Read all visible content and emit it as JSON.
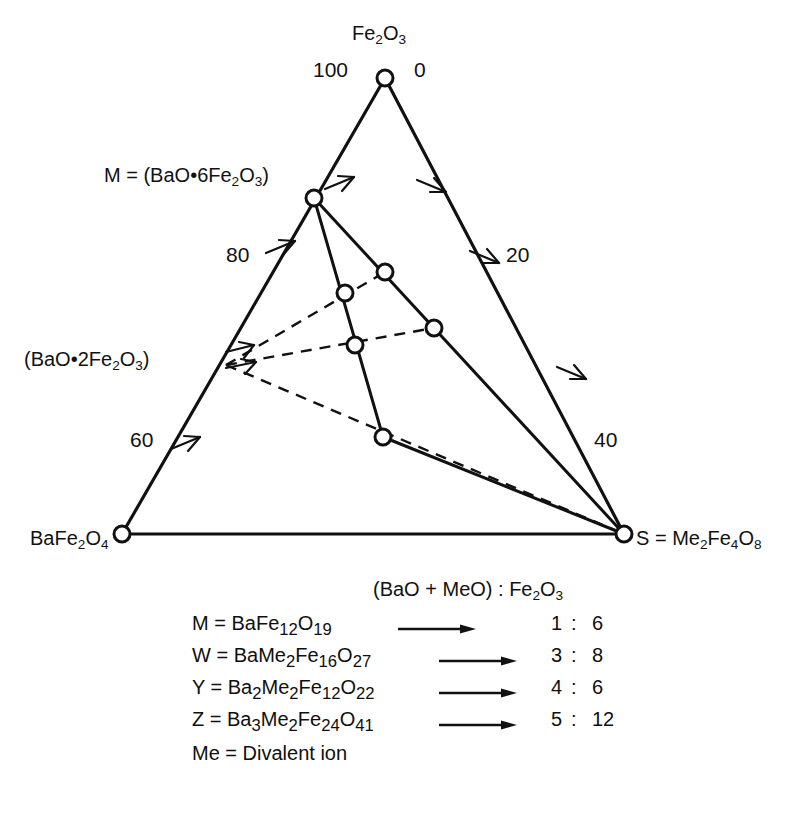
{
  "figure": {
    "type": "ternary-phase-diagram",
    "system": "BaO - MeO - Fe2O3 hexaferrite ternary diagram"
  },
  "vertices": {
    "top": {
      "label_html": "Fe<sub>2</sub>O<sub>3</sub>",
      "x": 385,
      "y": 78
    },
    "bottom_left": {
      "label_html": "BaFe<sub>2</sub>O<sub>4</sub>",
      "x": 122,
      "y": 534
    },
    "bottom_right": {
      "label_html": "S = Me<sub>2</sub>Fe<sub>4</sub>O<sub>8</sub>",
      "x": 624,
      "y": 534
    }
  },
  "interior_labels": {
    "m_phase": "M = (BaO•6Fe<sub>2</sub>O<sub>3</sub>)",
    "w_phase": "(BaO•2Fe<sub>2</sub>O<sub>3</sub>)"
  },
  "axis_ticks": [
    {
      "value": "100",
      "side": "top-left",
      "x": 313,
      "y": 60
    },
    {
      "value": "0",
      "side": "top-right",
      "x": 414,
      "y": 60
    },
    {
      "value": "80",
      "side": "left",
      "x": 235,
      "y": 245
    },
    {
      "value": "20",
      "side": "right",
      "x": 508,
      "y": 245
    },
    {
      "value": "60",
      "side": "left",
      "x": 138,
      "y": 430
    },
    {
      "value": "40",
      "side": "right",
      "x": 597,
      "y": 430
    }
  ],
  "nodes": [
    {
      "name": "fe2o3-apex",
      "x": 385,
      "y": 78
    },
    {
      "name": "m-phase",
      "x": 314,
      "y": 198
    },
    {
      "name": "w-phase-edge",
      "x": 226,
      "y": 365
    },
    {
      "name": "bafe2o4-corner",
      "x": 122,
      "y": 534
    },
    {
      "name": "s-corner",
      "x": 624,
      "y": 534
    },
    {
      "name": "node-upper-mid",
      "x": 385,
      "y": 272
    },
    {
      "name": "node-z",
      "x": 345,
      "y": 293
    },
    {
      "name": "node-right-mid",
      "x": 434,
      "y": 328
    },
    {
      "name": "node-y",
      "x": 355,
      "y": 345
    },
    {
      "name": "node-lower",
      "x": 383,
      "y": 437
    }
  ],
  "legend": {
    "header": "(BaO + MeO) : Fe<sub>2</sub>O<sub>3</sub>",
    "rows": [
      {
        "formula_html": "M = BaFe<sub>12</sub>O<sub>19</sub>",
        "ratio_a": "1",
        "colon": ":",
        "ratio_b": "6",
        "arrow_left": 206
      },
      {
        "formula_html": "W = BaMe<sub>2</sub>Fe<sub>16</sub>O<sub>27</sub>",
        "ratio_a": "3",
        "colon": ":",
        "ratio_b": "8",
        "arrow_left": 247
      },
      {
        "formula_html": "Y = Ba<sub>2</sub>Me<sub>2</sub>Fe<sub>12</sub>O<sub>22</sub>",
        "ratio_a": "4",
        "colon": ":",
        "ratio_b": "6",
        "arrow_left": 247
      },
      {
        "formula_html": "Z = Ba<sub>3</sub>Me<sub>2</sub>Fe<sub>24</sub>O<sub>41</sub>",
        "ratio_a": "5",
        "colon": ":",
        "ratio_b": "12",
        "arrow_left": 247
      }
    ],
    "note": "Me = Divalent ion"
  },
  "colors": {
    "stroke": "#111111",
    "background": "#ffffff",
    "node_fill": "#ffffff"
  }
}
